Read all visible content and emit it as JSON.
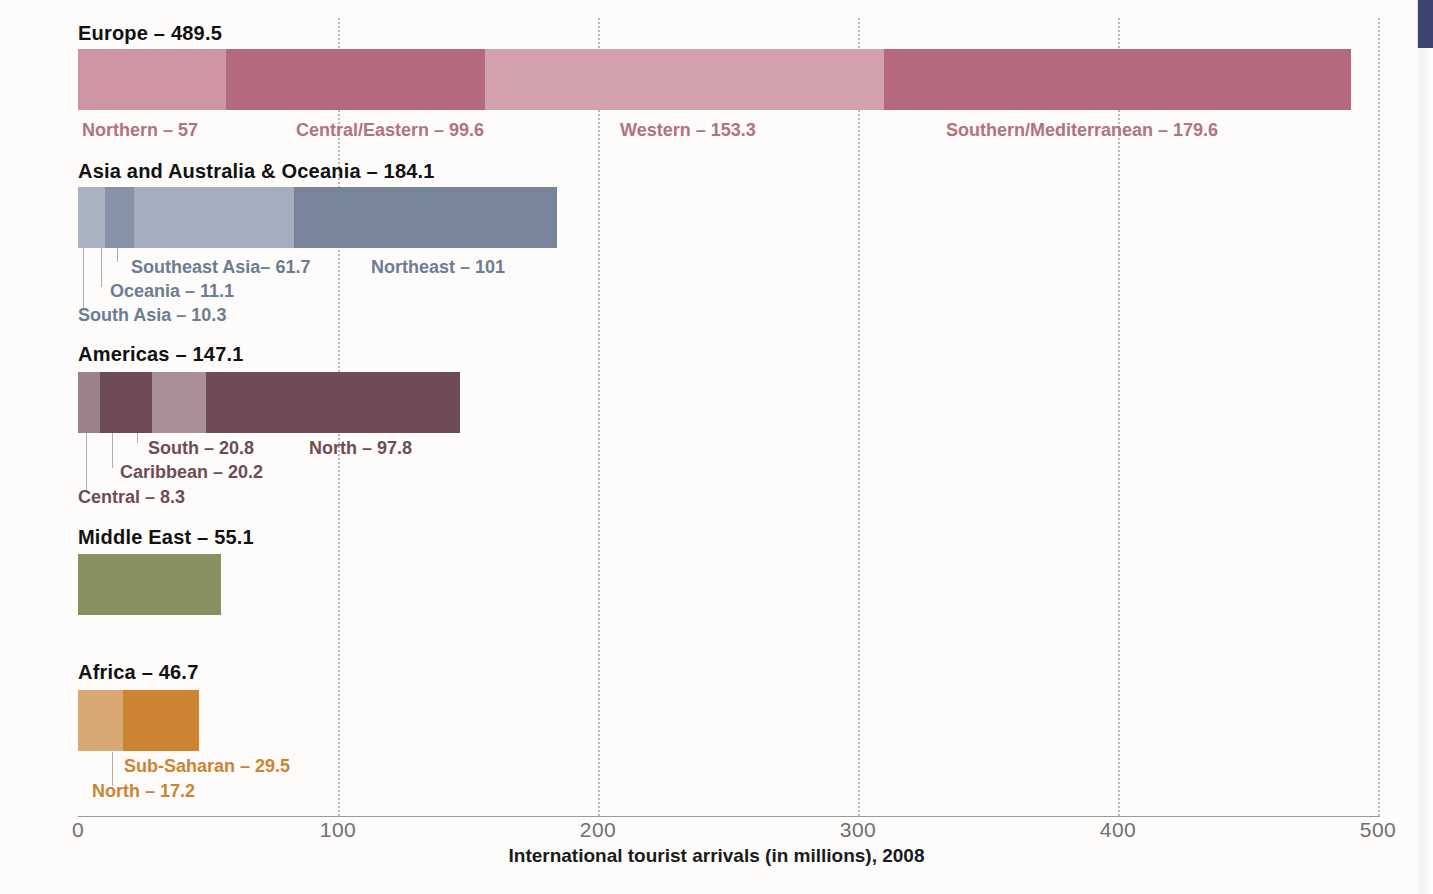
{
  "axis": {
    "title": "International tourist arrivals (in millions), 2008",
    "ticks": [
      "0",
      "100",
      "200",
      "300",
      "400",
      "500"
    ],
    "tick_values": [
      0,
      100,
      200,
      300,
      400,
      500
    ],
    "xmin": 0,
    "xmax": 500
  },
  "chart_data": {
    "type": "bar",
    "orientation": "horizontal",
    "stacked": true,
    "title": "",
    "xlabel": "International tourist arrivals (in millions), 2008",
    "ylabel": "",
    "xlim": [
      0,
      500
    ],
    "grid": "vertical-dotted",
    "legend": "inline-labels",
    "categories": [
      "Europe",
      "Asia and Australia & Oceania",
      "Americas",
      "Middle East",
      "Africa"
    ],
    "values": [
      489.5,
      184.1,
      147.1,
      55.1,
      46.7
    ],
    "groups": [
      {
        "name": "Europe",
        "label": "Europe – 489.5",
        "total": 489.5,
        "color": "#b4717f",
        "label_color": "#b4717f",
        "segments": [
          {
            "name": "Northern",
            "label": "Northern – 57",
            "value": 57,
            "color": "#cd95a3"
          },
          {
            "name": "Central/Eastern",
            "label": "Central/Eastern – 99.6",
            "value": 99.6,
            "color": "#b4697d"
          },
          {
            "name": "Western",
            "label": "Western – 153.3",
            "value": 153.3,
            "color": "#d2a1ac"
          },
          {
            "name": "Southern/Mediterranean",
            "label": "Southern/Mediterranean – 179.6",
            "value": 179.6,
            "color": "#b4697d"
          }
        ]
      },
      {
        "name": "Asia and Australia & Oceania",
        "label": "Asia and Australia & Oceania – 184.1",
        "total": 184.1,
        "color": "#6d7c92",
        "label_color": "#6d7c92",
        "segments": [
          {
            "name": "South Asia",
            "label": "South Asia – 10.3",
            "value": 10.3,
            "color": "#aab3c2"
          },
          {
            "name": "Oceania",
            "label": "Oceania – 11.1",
            "value": 11.1,
            "color": "#8794a8"
          },
          {
            "name": "Southeast Asia",
            "label": "Southeast Asia– 61.7",
            "value": 61.7,
            "color": "#a5aebe"
          },
          {
            "name": "Northeast",
            "label": "Northeast – 101",
            "value": 101,
            "color": "#77849a"
          }
        ]
      },
      {
        "name": "Americas",
        "label": "Americas – 147.1",
        "total": 147.1,
        "color": "#6e4c55",
        "label_color": "#6e4c55",
        "segments": [
          {
            "name": "Central",
            "label": "Central – 8.3",
            "value": 8.3,
            "color": "#9b8189"
          },
          {
            "name": "Caribbean",
            "label": "Caribbean – 20.2",
            "value": 20.2,
            "color": "#6d4c55"
          },
          {
            "name": "South",
            "label": "South – 20.8",
            "value": 20.8,
            "color": "#a98f96"
          },
          {
            "name": "North",
            "label": "North – 97.8",
            "value": 97.8,
            "color": "#6d4c55"
          }
        ]
      },
      {
        "name": "Middle East",
        "label": "Middle East – 55.1",
        "total": 55.1,
        "color": "#87915f",
        "label_color": "#87915f",
        "segments": [
          {
            "name": "Middle East",
            "label": "",
            "value": 55.1,
            "color": "#87915f"
          }
        ]
      },
      {
        "name": "Africa",
        "label": "Africa – 46.7",
        "total": 46.7,
        "color": "#cc8432",
        "label_color": "#cc8432",
        "segments": [
          {
            "name": "North",
            "label": "North – 17.2",
            "value": 17.2,
            "color": "#d8a873"
          },
          {
            "name": "Sub-Saharan",
            "label": "Sub-Saharan – 29.5",
            "value": 29.5,
            "color": "#cc8432"
          }
        ]
      }
    ]
  }
}
